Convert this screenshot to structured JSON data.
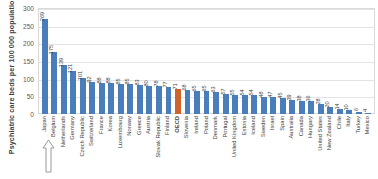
{
  "chart_data": {
    "type": "bar",
    "title": "",
    "xlabel": "",
    "ylabel": "Psychiatric care beds per 100 000 population",
    "ylim": [
      0,
      300
    ],
    "yticks": [
      0,
      50,
      100,
      150,
      200,
      250,
      300
    ],
    "grid": true,
    "legend": "none",
    "highlight_category": "OECD",
    "categories": [
      "Japan",
      "Belgium",
      "Netherlands",
      "Germany",
      "Czech Republic",
      "Switzerland",
      "France",
      "Korea",
      "Luxembourg",
      "Norway",
      "Greece",
      "Austria",
      "Slovak Republic",
      "Finland",
      "OECD",
      "Slovenia",
      "Ireland",
      "Poland",
      "Denmark",
      "Portugal",
      "United Kingdom",
      "Estonia",
      "Iceland",
      "Sweden",
      "Israel",
      "Spain",
      "Australia",
      "Canada",
      "Hungary",
      "United States",
      "New Zealand",
      "Chile",
      "Italy",
      "Turkey",
      "Mexico"
    ],
    "values": [
      269,
      175,
      139,
      121,
      101,
      92,
      88,
      88,
      85,
      85,
      83,
      80,
      78,
      77,
      71,
      68,
      65,
      65,
      63,
      57,
      55,
      54,
      54,
      48,
      47,
      45,
      39,
      38,
      36,
      28,
      20,
      14,
      10,
      6,
      4
    ],
    "value_labels": [
      "269",
      "175",
      "139",
      "121",
      "101",
      "92",
      "88",
      "88",
      "85",
      "85",
      "83",
      "80",
      "78",
      "77",
      "71",
      "68",
      "65",
      "65",
      "63",
      "57",
      "55",
      "54",
      "54",
      "48",
      "47",
      "45",
      "39",
      "38",
      "36",
      "28",
      "20",
      "14",
      "10",
      "6",
      "4"
    ],
    "colors": {
      "bar": "#4a7ebb",
      "highlight_bar": "#d1622b",
      "gridline": "#e4e4e4",
      "frame": "#d9d9d9",
      "text": "#404040"
    }
  },
  "annotations": {
    "arrow": "up-arrow-icon"
  }
}
